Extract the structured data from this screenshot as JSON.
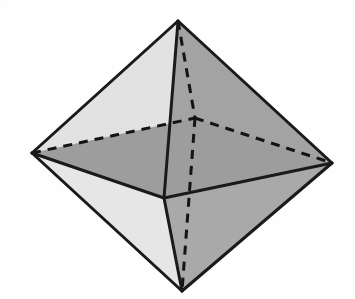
{
  "figure": {
    "kind": "polyhedron-line-drawing"
  },
  "canvas": {
    "width": 355,
    "height": 299,
    "background_color": "#fefefe"
  },
  "style": {
    "edge_color": "#1a1a1a",
    "edge_width": 3.0,
    "hidden_edge_color": "#141414",
    "hidden_edge_width": 3.0,
    "hidden_edge_dash": "9 7",
    "face_light": "#e6e6e6",
    "face_light_alt": "#e2e2e2",
    "face_mid": "#a9a9a9",
    "face_mid_alt": "#a3a3a3",
    "face_dark": "#9d9d9d"
  },
  "vertices": {
    "top": {
      "label": "top apex",
      "x": 178,
      "y": 21
    },
    "bottom": {
      "label": "bottom apex",
      "x": 182,
      "y": 291
    },
    "left": {
      "label": "left equator vertex",
      "x": 32,
      "y": 153
    },
    "right": {
      "label": "right equator vertex",
      "x": 332,
      "y": 163
    },
    "front": {
      "label": "front equator vertex",
      "x": 164,
      "y": 198
    },
    "back": {
      "label": "back equator vertex (hidden)",
      "x": 195,
      "y": 118
    }
  },
  "faces": [
    {
      "name": "top-left-back-face",
      "points": "178,21 32,153 195,118",
      "fill": "#e6e6e6"
    },
    {
      "name": "top-left-front-face",
      "points": "178,21 32,153 164,198",
      "fill": "#e2e2e2"
    },
    {
      "name": "top-right-back-face",
      "points": "178,21 195,118 332,163",
      "fill": "#a9a9a9"
    },
    {
      "name": "top-right-front-face",
      "points": "178,21 164,198 332,163",
      "fill": "#a3a3a3"
    },
    {
      "name": "bottom-left-face",
      "points": "182,291 32,153 164,198",
      "fill": "#e6e6e6"
    },
    {
      "name": "bottom-right-face",
      "points": "182,291 164,198 332,163",
      "fill": "#a9a9a9"
    },
    {
      "name": "equator-left-wedge",
      "points": "32,153 195,118 164,198",
      "fill": "#9d9d9d"
    },
    {
      "name": "equator-right-wedge",
      "points": "195,118 332,163 164,198",
      "fill": "#9d9d9d"
    }
  ],
  "visible_edges": [
    {
      "name": "edge-top-to-left",
      "x1": 178,
      "y1": 21,
      "x2": 32,
      "y2": 153
    },
    {
      "name": "edge-top-to-right",
      "x1": 178,
      "y1": 21,
      "x2": 332,
      "y2": 163
    },
    {
      "name": "edge-top-to-front",
      "x1": 178,
      "y1": 21,
      "x2": 164,
      "y2": 198
    },
    {
      "name": "edge-left-to-front",
      "x1": 32,
      "y1": 153,
      "x2": 164,
      "y2": 198
    },
    {
      "name": "edge-front-to-right",
      "x1": 164,
      "y1": 198,
      "x2": 332,
      "y2": 163
    },
    {
      "name": "edge-left-to-bottom",
      "x1": 32,
      "y1": 153,
      "x2": 182,
      "y2": 291
    },
    {
      "name": "edge-right-to-bottom",
      "x1": 332,
      "y1": 163,
      "x2": 182,
      "y2": 291
    },
    {
      "name": "edge-front-to-bottom",
      "x1": 164,
      "y1": 198,
      "x2": 182,
      "y2": 291
    }
  ],
  "hidden_edges": [
    {
      "name": "hidden-edge-top-to-back",
      "x1": 178,
      "y1": 21,
      "x2": 195,
      "y2": 118
    },
    {
      "name": "hidden-edge-left-to-back",
      "x1": 32,
      "y1": 153,
      "x2": 195,
      "y2": 118
    },
    {
      "name": "hidden-edge-back-to-right",
      "x1": 195,
      "y1": 118,
      "x2": 332,
      "y2": 163
    },
    {
      "name": "hidden-edge-back-to-bottom",
      "x1": 195,
      "y1": 118,
      "x2": 182,
      "y2": 291
    }
  ]
}
